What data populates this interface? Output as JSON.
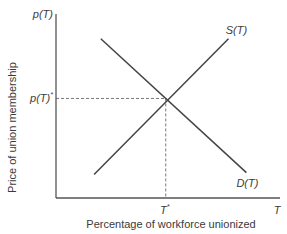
{
  "chart_data": {
    "type": "line",
    "title": "",
    "xlabel": "Percentage of workforce unionized",
    "ylabel": "Price of union membership",
    "x_axis_symbol": "T",
    "y_axis_symbol": "p(T)",
    "xlim": [
      0,
      100
    ],
    "ylim": [
      0,
      100
    ],
    "grid": false,
    "legend": "none",
    "series": [
      {
        "name": "S(T)",
        "role": "supply",
        "label": "S(T)",
        "label_position": "end-top",
        "points": [
          [
            17,
            13
          ],
          [
            77,
            88
          ]
        ]
      },
      {
        "name": "D(T)",
        "role": "demand",
        "label": "D(T)",
        "label_position": "end-bottom",
        "points": [
          [
            20,
            88
          ],
          [
            85,
            14
          ]
        ]
      }
    ],
    "equilibrium": {
      "x": 49,
      "y": 55,
      "x_label": "T",
      "x_label_sup": "*",
      "y_label": "p(T)",
      "y_label_sup": "*",
      "guide_lines": "dashed"
    },
    "colors": {
      "axes": "#555555",
      "curves": "#444444",
      "guides": "#777777",
      "text": "#3a3a3a"
    }
  }
}
